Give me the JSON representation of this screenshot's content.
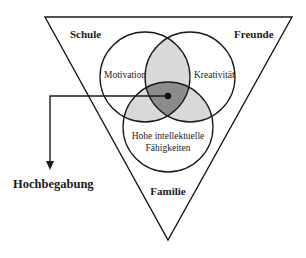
{
  "diagram": {
    "environment_labels": {
      "top_left": "Schule",
      "top_right": "Freunde",
      "bottom": "Familie"
    },
    "circles": [
      {
        "label": "Motivation"
      },
      {
        "label": "Kreativität"
      },
      {
        "label_line1": "Hohe intellektuelle",
        "label_line2": "Fähigkeiten"
      }
    ],
    "result_label": "Hochbegabung",
    "colors": {
      "stroke": "#1a1a1a",
      "pair_overlap": "#d9d9d9",
      "triple_overlap": "#8c8c8c",
      "background": "#ffffff"
    }
  }
}
